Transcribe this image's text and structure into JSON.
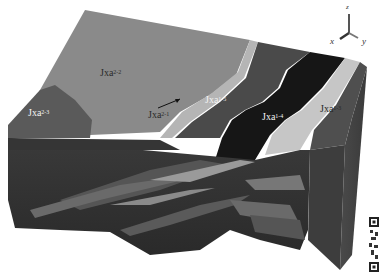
{
  "figure": {
    "type": "3D geological block model",
    "units": [
      {
        "id": "jxa2-2",
        "base": "Jxa",
        "sup": "2-2",
        "color": "#8a8a8a"
      },
      {
        "id": "jxa2-3",
        "base": "Jxa",
        "sup": "2-3",
        "color": "#5a5a5a"
      },
      {
        "id": "jxa2-1",
        "base": "Jxa",
        "sup": "2-1",
        "color": "#b8b8b8"
      },
      {
        "id": "jxa1-5",
        "base": "Jxa",
        "sup": "1-5",
        "color": "#4a4a4a"
      },
      {
        "id": "jxa1-4",
        "base": "Jxa",
        "sup": "1-4",
        "color": "#1a1a1a"
      },
      {
        "id": "jxa1-3",
        "base": "Jxa",
        "sup": "1-3",
        "color": "#c8c8c8"
      }
    ],
    "labels": {
      "jxa2_2": {
        "base": "Jxa",
        "sup": "2-2"
      },
      "jxa2_3": {
        "base": "Jxa",
        "sup": "2-3"
      },
      "jxa2_1": {
        "base": "Jxa",
        "sup": "2-1"
      },
      "jxa1_5": {
        "base": "Jxa",
        "sup": "1-5"
      },
      "jxa1_4": {
        "base": "Jxa",
        "sup": "1-4"
      },
      "jxa1_3": {
        "base": "Jxa",
        "sup": "1-3"
      }
    },
    "axes": {
      "x": "x",
      "y": "y",
      "z": "z"
    }
  }
}
